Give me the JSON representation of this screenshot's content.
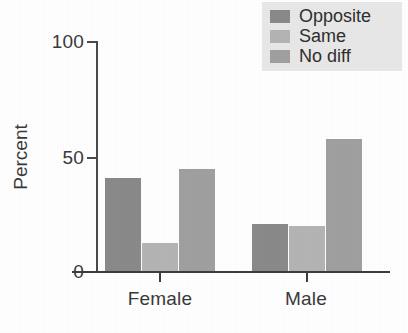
{
  "chart_data": {
    "type": "bar",
    "title": "",
    "xlabel": "",
    "ylabel": "Percent",
    "categories": [
      "Female",
      "Male"
    ],
    "series": [
      {
        "name": "Opposite",
        "values": [
          41,
          21
        ],
        "color": "#8a8a8a"
      },
      {
        "name": "Same",
        "values": [
          12.5,
          20
        ],
        "color": "#b4b4b4"
      },
      {
        "name": "No diff",
        "values": [
          45,
          58
        ],
        "color": "#a0a0a0"
      }
    ],
    "ylim": [
      0,
      100
    ],
    "yticks": [
      0,
      50,
      100
    ],
    "ytick_labels": [
      "0",
      "50",
      "100"
    ],
    "grid": false,
    "legend_position": "top-right"
  },
  "axes": {
    "y_title": "Percent",
    "y_ticks": [
      {
        "label": "100",
        "value": 100
      },
      {
        "label": "50",
        "value": 50
      },
      {
        "label": "0",
        "value": 0
      }
    ],
    "x_groups": [
      {
        "label": "Female"
      },
      {
        "label": "Male"
      }
    ]
  },
  "legend": {
    "background": "#e8e8e8",
    "items": [
      {
        "label": "Opposite",
        "color": "#8a8a8a"
      },
      {
        "label": "Same",
        "color": "#b4b4b4"
      },
      {
        "label": "No diff",
        "color": "#a0a0a0"
      }
    ]
  }
}
